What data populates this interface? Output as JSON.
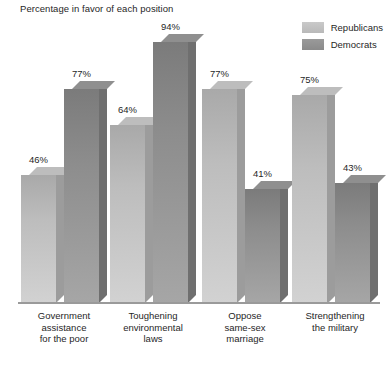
{
  "chart_data": {
    "type": "bar",
    "title": "Percentage in favor of each position",
    "xlabel": "",
    "ylabel": "",
    "ylim": [
      0,
      100
    ],
    "grid": false,
    "legend_position": "top-right",
    "categories": [
      "Government assistance for the poor",
      "Toughening environmental laws",
      "Oppose same-sex marriage",
      "Strengthening the military"
    ],
    "category_lines": [
      [
        "Government",
        "assistance",
        "for the poor"
      ],
      [
        "Toughening",
        "environmental",
        "laws"
      ],
      [
        "Oppose",
        "same-sex",
        "marriage"
      ],
      [
        "Strengthening",
        "the military"
      ]
    ],
    "series": [
      {
        "name": "Republicans",
        "color": "#b9b9b9",
        "values": [
          46,
          64,
          77,
          75
        ],
        "labels": [
          "46%",
          "64%",
          "77%",
          "75%"
        ]
      },
      {
        "name": "Democrats",
        "color": "#8a8a8a",
        "values": [
          77,
          94,
          41,
          43
        ],
        "labels": [
          "77%",
          "94%",
          "41%",
          "43%"
        ]
      }
    ]
  },
  "legend": {
    "items": [
      {
        "label": "Republicans",
        "swatch_color": "#b9b9b9"
      },
      {
        "label": "Democrats",
        "swatch_color": "#8a8a8a"
      }
    ]
  },
  "colors": {
    "background": "#ffffff",
    "axis_line": "#9a9a9a",
    "text": "#1f1f1f",
    "republican_front": "#b9b9b9",
    "republican_side": "#9c9c9c",
    "democrat_front": "#8a8a8a",
    "democrat_side": "#6f6f6f"
  }
}
